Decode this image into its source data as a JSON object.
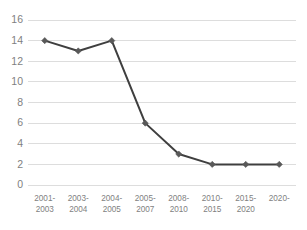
{
  "chart_data": {
    "type": "line",
    "title": "",
    "subtitle": "",
    "xlabel": "",
    "ylabel": "",
    "categories": [
      "2001-\n2003",
      "2003-\n2004",
      "2004-\n2005",
      "2005-\n2007",
      "2008-\n2010",
      "2010-\n2015",
      "2015-\n2020",
      "2020-"
    ],
    "category_lines": [
      [
        "2001-",
        "2003"
      ],
      [
        "2003-",
        "2004"
      ],
      [
        "2004-",
        "2005"
      ],
      [
        "2005-",
        "2007"
      ],
      [
        "2008-",
        "2010"
      ],
      [
        "2010-",
        "2015"
      ],
      [
        "2015-",
        "2020"
      ],
      [
        "2020-",
        ""
      ]
    ],
    "values": [
      14,
      13,
      14,
      6,
      3,
      2,
      2,
      2
    ],
    "ylim": [
      0,
      16
    ],
    "ytick_values": [
      0,
      2,
      4,
      6,
      8,
      10,
      12,
      14,
      16
    ],
    "ytick_labels": [
      "0",
      "2",
      "4",
      "6",
      "8",
      "10",
      "12",
      "14",
      "16"
    ],
    "grid": "horizontal",
    "legend": "none",
    "marker": "diamond",
    "colors": {
      "line": "#3f3f3f",
      "marker": "#595959",
      "gridline": "#d9d9d9",
      "tick_label": "#7f7f7f",
      "background": "#ffffff"
    }
  }
}
